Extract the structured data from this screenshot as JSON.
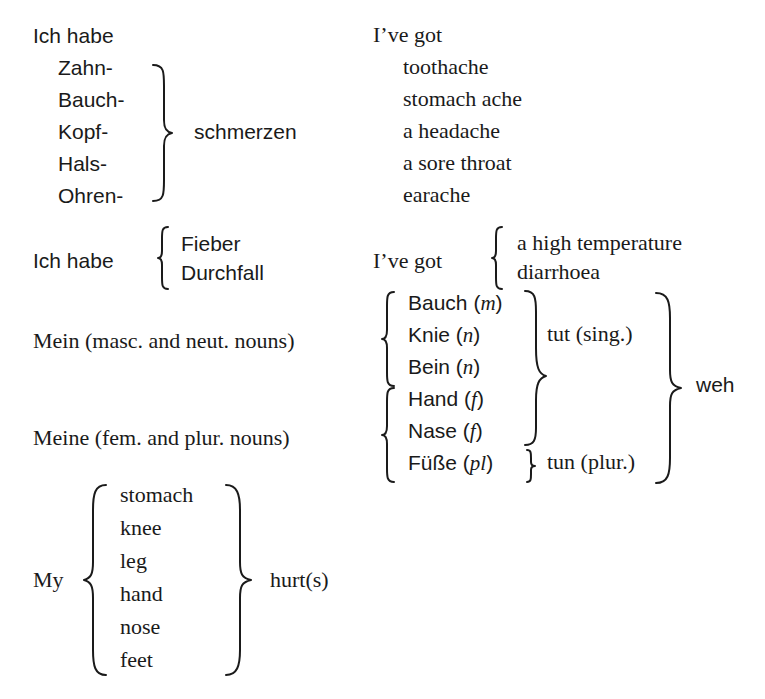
{
  "section1": {
    "german_intro": "Ich habe",
    "prefixes": [
      "Zahn-",
      "Bauch-",
      "Kopf-",
      "Hals-",
      "Ohren-"
    ],
    "suffix": "schmerzen",
    "english_intro": "I’ve got",
    "translations": [
      "toothache",
      "stomach ache",
      "a headache",
      "a sore throat",
      "earache"
    ]
  },
  "section2": {
    "german_intro": "Ich habe",
    "german_items": [
      "Fieber",
      "Durchfall"
    ],
    "english_intro": "I’ve got",
    "english_items": [
      "a high temperature",
      "diarrhoea"
    ]
  },
  "section3": {
    "mein_label": "Mein (masc. and neut. nouns)",
    "meine_label": "Meine (fem. and plur. nouns)",
    "nouns": [
      {
        "word": "Bauch",
        "gender": "m"
      },
      {
        "word": "Knie",
        "gender": "n"
      },
      {
        "word": "Bein",
        "gender": "n"
      },
      {
        "word": "Hand",
        "gender": "f"
      },
      {
        "word": "Nase",
        "gender": "f"
      },
      {
        "word": "Füße",
        "gender": "pl"
      }
    ],
    "verb_singular": "tut (sing.)",
    "verb_plural": "tun (plur.)",
    "ending": "weh"
  },
  "section4": {
    "intro": "My",
    "items": [
      "stomach",
      "knee",
      "leg",
      "hand",
      "nose",
      "feet"
    ],
    "ending": "hurt(s)"
  }
}
